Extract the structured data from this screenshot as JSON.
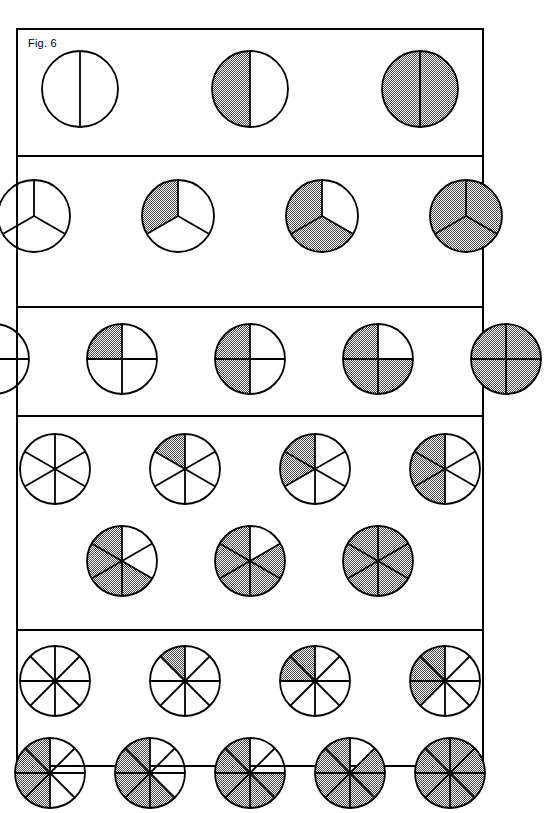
{
  "figure": {
    "label": "Fig. 6",
    "background": "#ffffff",
    "line_color": "#000000",
    "shade_color": "#a8a8a8",
    "frame": {
      "x": 16,
      "y": 28,
      "width": 468,
      "height": 739,
      "border_width": 2
    }
  },
  "chart_data": {
    "type": "diagram",
    "title": "Fig. 6",
    "rows": [
      {
        "name": "halves",
        "denominator": 2,
        "orientation": "vertical-split",
        "circle_radius": 38,
        "lines": [
          {
            "circles": [
              {
                "shaded": 0,
                "denominator": 2,
                "fraction": "0/2",
                "shaded_indices": []
              },
              {
                "shaded": 1,
                "denominator": 2,
                "fraction": "1/2",
                "shaded_indices": [
                  1
                ]
              },
              {
                "shaded": 2,
                "denominator": 2,
                "fraction": "2/2",
                "shaded_indices": [
                  0,
                  1
                ]
              }
            ]
          }
        ]
      },
      {
        "name": "thirds",
        "denominator": 3,
        "orientation": "mercedes",
        "circle_radius": 36,
        "lines": [
          {
            "circles": [
              {
                "shaded": 0,
                "denominator": 3,
                "fraction": "0/3",
                "shaded_indices": []
              },
              {
                "shaded": 1,
                "denominator": 3,
                "fraction": "1/3",
                "shaded_indices": [
                  2
                ]
              },
              {
                "shaded": 2,
                "denominator": 3,
                "fraction": "2/3",
                "shaded_indices": [
                  1,
                  2
                ]
              },
              {
                "shaded": 3,
                "denominator": 3,
                "fraction": "3/3",
                "shaded_indices": [
                  0,
                  1,
                  2
                ]
              }
            ]
          }
        ]
      },
      {
        "name": "quarters",
        "denominator": 4,
        "orientation": "cross",
        "circle_radius": 35,
        "lines": [
          {
            "circles": [
              {
                "shaded": 0,
                "denominator": 4,
                "fraction": "0/4",
                "shaded_indices": []
              },
              {
                "shaded": 1,
                "denominator": 4,
                "fraction": "1/4",
                "shaded_indices": [
                  3
                ]
              },
              {
                "shaded": 2,
                "denominator": 4,
                "fraction": "2/4",
                "shaded_indices": [
                  2,
                  3
                ]
              },
              {
                "shaded": 3,
                "denominator": 4,
                "fraction": "3/4",
                "shaded_indices": [
                  1,
                  2,
                  3
                ]
              },
              {
                "shaded": 4,
                "denominator": 4,
                "fraction": "4/4",
                "shaded_indices": [
                  0,
                  1,
                  2,
                  3
                ]
              }
            ]
          }
        ]
      },
      {
        "name": "sixths",
        "denominator": 6,
        "orientation": "six-wedge",
        "circle_radius": 35,
        "lines": [
          {
            "circles": [
              {
                "shaded": 0,
                "denominator": 6,
                "fraction": "0/6",
                "shaded_indices": []
              },
              {
                "shaded": 1,
                "denominator": 6,
                "fraction": "1/6",
                "shaded_indices": [
                  5
                ]
              },
              {
                "shaded": 2,
                "denominator": 6,
                "fraction": "2/6",
                "shaded_indices": [
                  4,
                  5
                ]
              },
              {
                "shaded": 3,
                "denominator": 6,
                "fraction": "3/6",
                "shaded_indices": [
                  3,
                  4,
                  5
                ]
              }
            ]
          },
          {
            "circles": [
              {
                "shaded": 4,
                "denominator": 6,
                "fraction": "4/6",
                "shaded_indices": [
                  2,
                  3,
                  4,
                  5
                ]
              },
              {
                "shaded": 5,
                "denominator": 6,
                "fraction": "5/6",
                "shaded_indices": [
                  1,
                  2,
                  3,
                  4,
                  5
                ]
              },
              {
                "shaded": 6,
                "denominator": 6,
                "fraction": "6/6",
                "shaded_indices": [
                  0,
                  1,
                  2,
                  3,
                  4,
                  5
                ]
              }
            ]
          }
        ]
      },
      {
        "name": "eighths",
        "denominator": 8,
        "orientation": "eight-wedge",
        "circle_radius": 35,
        "lines": [
          {
            "circles": [
              {
                "shaded": 0,
                "denominator": 8,
                "fraction": "0/8",
                "shaded_indices": []
              },
              {
                "shaded": 1,
                "denominator": 8,
                "fraction": "1/8",
                "shaded_indices": [
                  7
                ]
              },
              {
                "shaded": 2,
                "denominator": 8,
                "fraction": "2/8",
                "shaded_indices": [
                  6,
                  7
                ]
              },
              {
                "shaded": 3,
                "denominator": 8,
                "fraction": "3/8",
                "shaded_indices": [
                  5,
                  6,
                  7
                ]
              }
            ]
          },
          {
            "circles": [
              {
                "shaded": 4,
                "denominator": 8,
                "fraction": "4/8",
                "shaded_indices": [
                  4,
                  5,
                  6,
                  7
                ]
              },
              {
                "shaded": 5,
                "denominator": 8,
                "fraction": "5/8",
                "shaded_indices": [
                  3,
                  4,
                  5,
                  6,
                  7
                ]
              },
              {
                "shaded": 6,
                "denominator": 8,
                "fraction": "6/8",
                "shaded_indices": [
                  2,
                  3,
                  4,
                  5,
                  6,
                  7
                ]
              },
              {
                "shaded": 7,
                "denominator": 8,
                "fraction": "7/8",
                "shaded_indices": [
                  1,
                  2,
                  3,
                  4,
                  5,
                  6,
                  7
                ]
              },
              {
                "shaded": 8,
                "denominator": 8,
                "fraction": "8/8",
                "shaded_indices": [
                  0,
                  1,
                  2,
                  3,
                  4,
                  5,
                  6,
                  7
                ]
              }
            ]
          }
        ]
      }
    ]
  },
  "layout": {
    "row_heights": [
      109,
      131,
      96,
      200,
      199
    ],
    "line_paddings": [
      [
        {
          "top": 18,
          "gaps": [
            88,
            88
          ],
          "left": 96
        }
      ],
      [
        {
          "top": 20,
          "gaps": [
            66,
            66,
            66
          ],
          "left": 50
        }
      ],
      [
        {
          "top": 13,
          "gaps": [
            52,
            52,
            52,
            52
          ],
          "left": 22
        }
      ],
      [
        {
          "top": 14,
          "gaps": [
            54,
            54,
            54
          ],
          "left": 52
        },
        {
          "top": 16,
          "gaps": [
            52,
            52
          ],
          "left": 100
        }
      ],
      [
        {
          "top": 12,
          "gaps": [
            54,
            54,
            54
          ],
          "left": 52
        },
        {
          "top": 16,
          "gaps": [
            24,
            24,
            24,
            24
          ],
          "left": 18
        }
      ]
    ]
  }
}
